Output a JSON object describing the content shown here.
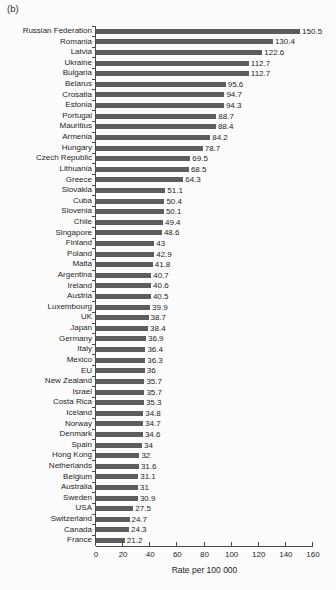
{
  "figure": {
    "panel_label": "(b)"
  },
  "chart_data": {
    "type": "bar",
    "orientation": "horizontal",
    "title": "",
    "xlabel": "Rate per 100 000",
    "ylabel": "",
    "xlim": [
      0,
      160
    ],
    "xticks": [
      0,
      20,
      40,
      60,
      80,
      100,
      120,
      140,
      160
    ],
    "grid": false,
    "bar_color": "#5d5d5d",
    "axis_color": "#4a4a4a",
    "categories": [
      "Russian Federation",
      "Romania",
      "Latvia",
      "Ukraine",
      "Bulgaria",
      "Belarus",
      "Crosatia",
      "Estonia",
      "Portugal",
      "Mauritius",
      "Armenia",
      "Hungary",
      "Czech Republic",
      "Lithuania",
      "Greece",
      "Slovakia",
      "Cuba",
      "Slovenia",
      "Chile",
      "Singapore",
      "Finland",
      "Poland",
      "Malta",
      "Argentina",
      "Ireland",
      "Austria",
      "Luxembourg",
      "UK",
      "Japan",
      "Germany",
      "Italy",
      "Mexico",
      "EU",
      "New Zealand",
      "Israel",
      "Costa Rica",
      "Iceland",
      "Norway",
      "Denmark",
      "Spain",
      "Hong Kong",
      "Netherlands",
      "Belgium",
      "Australia",
      "Sweden",
      "USA",
      "Switzerland",
      "Canada",
      "France"
    ],
    "values": [
      150.5,
      130.4,
      122.6,
      112.7,
      112.7,
      95.6,
      94.7,
      94.3,
      88.7,
      88.4,
      84.2,
      78.7,
      69.5,
      68.5,
      64.3,
      51.1,
      50.4,
      50.1,
      49.4,
      48.6,
      43,
      42.9,
      41.8,
      40.7,
      40.6,
      40.5,
      39.9,
      38.7,
      38.4,
      36.9,
      36.4,
      36.3,
      36,
      35.7,
      35.7,
      35.3,
      34.8,
      34.7,
      34.6,
      34,
      32,
      31.6,
      31.1,
      31,
      30.9,
      27.5,
      24.7,
      24.3,
      21.2
    ]
  }
}
